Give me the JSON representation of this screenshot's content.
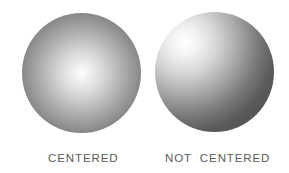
{
  "figure": {
    "panels": [
      {
        "label": "CENTERED",
        "highlight": "center",
        "shape": "sphere-gradient"
      },
      {
        "label": "NOT CENTERED",
        "highlight": "upper-left",
        "shape": "sphere-gradient"
      }
    ],
    "colors": {
      "highlight": "#ffffff",
      "shadow": "#4a4a4a",
      "label": "#5a5a5a",
      "background": "#ffffff"
    }
  }
}
